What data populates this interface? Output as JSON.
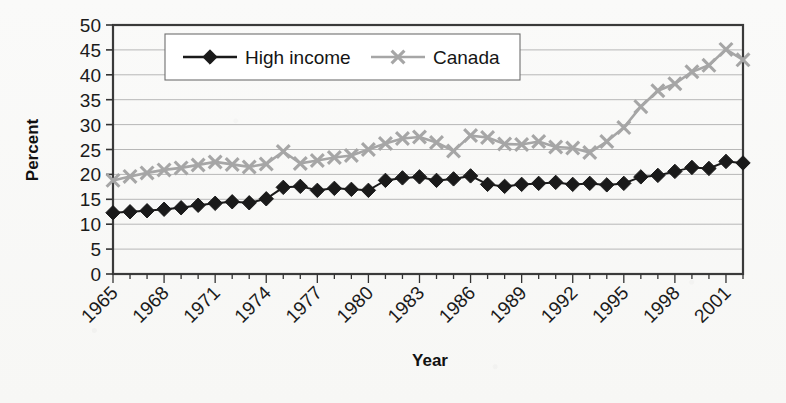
{
  "chart_data": {
    "type": "line",
    "title": "",
    "xlabel": "Year",
    "ylabel": "Percent",
    "ylim": [
      0,
      50
    ],
    "ytick_step": 5,
    "yticks": [
      0,
      5,
      10,
      15,
      20,
      25,
      30,
      35,
      40,
      45,
      50
    ],
    "xlim": [
      1965,
      2002
    ],
    "xticks": [
      1965,
      1968,
      1971,
      1974,
      1977,
      1980,
      1983,
      1986,
      1989,
      1992,
      1995,
      1998,
      2001
    ],
    "xtick_labels": [
      "1965",
      "1968",
      "1971",
      "1974",
      "1977",
      "1980",
      "1983",
      "1986",
      "1989",
      "1992",
      "1995",
      "1998",
      "2001"
    ],
    "xtick_rotation_deg": 45,
    "grid": "horizontal",
    "legend_position": "top-center-inside",
    "x": [
      1965,
      1966,
      1967,
      1968,
      1969,
      1970,
      1971,
      1972,
      1973,
      1974,
      1975,
      1976,
      1977,
      1978,
      1979,
      1980,
      1981,
      1982,
      1983,
      1984,
      1985,
      1986,
      1987,
      1988,
      1989,
      1990,
      1991,
      1992,
      1993,
      1994,
      1995,
      1996,
      1997,
      1998,
      1999,
      2000,
      2001,
      2002
    ],
    "series": [
      {
        "name": "High income",
        "marker": "diamond",
        "color": "#1a1a1a",
        "values": [
          12.3,
          12.5,
          12.7,
          13.0,
          13.3,
          13.8,
          14.2,
          14.5,
          14.3,
          15.1,
          17.4,
          17.6,
          16.8,
          17.2,
          17.0,
          16.8,
          18.8,
          19.3,
          19.5,
          18.8,
          19.1,
          19.7,
          18.0,
          17.6,
          18.0,
          18.2,
          18.4,
          18.0,
          18.2,
          17.9,
          18.2,
          19.5,
          19.8,
          20.6,
          21.4,
          21.2,
          22.6,
          22.3
        ]
      },
      {
        "name": "Canada",
        "marker": "x",
        "color": "#a6a6a6",
        "values": [
          18.8,
          19.6,
          20.3,
          20.9,
          21.3,
          21.9,
          22.5,
          22.0,
          21.5,
          22.1,
          24.6,
          22.2,
          22.8,
          23.4,
          23.8,
          25.0,
          26.2,
          27.2,
          27.5,
          26.4,
          24.7,
          27.8,
          27.4,
          26.1,
          26.0,
          26.6,
          25.5,
          25.3,
          24.4,
          26.6,
          29.4,
          33.6,
          36.8,
          38.2,
          40.6,
          41.9,
          45.1,
          43.0
        ]
      }
    ]
  },
  "plot": {
    "left": 113,
    "top": 25,
    "right": 743,
    "bottom": 274
  },
  "legend": {
    "box": {
      "x": 165,
      "y": 34,
      "width": 355,
      "height": 46
    },
    "items": [
      {
        "label": "High income",
        "marker": "diamond-icon"
      },
      {
        "label": "Canada",
        "marker": "x-icon"
      }
    ]
  },
  "colors": {
    "high_income": "#1a1a1a",
    "canada": "#a6a6a6",
    "axis": "#333333",
    "grid": "#b7b7b7",
    "text": "#141414",
    "page_background": "#fbfbfa"
  }
}
